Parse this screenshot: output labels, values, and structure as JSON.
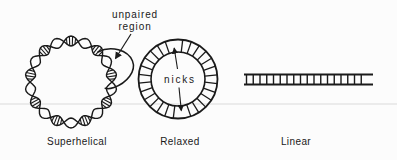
{
  "figure": {
    "background_color": "#fcfcfc",
    "ink_color": "#1a1a1a",
    "rule_line_color": "#dadada",
    "forms": [
      {
        "id": "superhelical",
        "caption": "Superhelical",
        "annotation_lines": [
          "unpaired",
          "region"
        ]
      },
      {
        "id": "relaxed",
        "caption": "Relaxed",
        "annotation": "nicks",
        "nick_count": 2
      },
      {
        "id": "linear",
        "caption": "Linear"
      }
    ]
  }
}
